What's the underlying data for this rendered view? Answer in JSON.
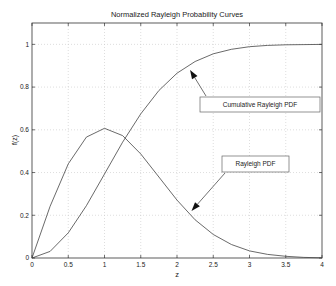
{
  "chart_data": {
    "type": "line",
    "title": "Normalized Rayleigh Probability Curves",
    "xlabel": "z",
    "ylabel": "f(z)",
    "xlim": [
      0,
      4
    ],
    "ylim": [
      0,
      1.1
    ],
    "grid": true,
    "xticks": [
      0,
      0.5,
      1,
      1.5,
      2,
      2.5,
      3,
      3.5,
      4
    ],
    "xtick_labels": [
      "0",
      "0.5",
      "1",
      "1.5",
      "2",
      "2.5",
      "3",
      "3.5",
      "4"
    ],
    "yticks": [
      0,
      0.2,
      0.4,
      0.6,
      0.8,
      1
    ],
    "ytick_labels": [
      "0",
      "0.2",
      "0.4",
      "0.6",
      "0.8",
      "1"
    ],
    "x": [
      0,
      0.25,
      0.5,
      0.75,
      1,
      1.25,
      1.5,
      1.75,
      2,
      2.25,
      2.5,
      2.75,
      3,
      3.25,
      3.5,
      3.75,
      4
    ],
    "series": [
      {
        "name": "Rayleigh PDF",
        "values": [
          0,
          0.242,
          0.441,
          0.566,
          0.607,
          0.573,
          0.487,
          0.379,
          0.271,
          0.179,
          0.11,
          0.063,
          0.033,
          0.017,
          0.008,
          0.003,
          0.001
        ]
      },
      {
        "name": "Cumulative Rayleigh PDF",
        "values": [
          0,
          0.031,
          0.118,
          0.245,
          0.393,
          0.542,
          0.675,
          0.784,
          0.865,
          0.92,
          0.956,
          0.977,
          0.989,
          0.995,
          0.998,
          0.999,
          1.0
        ]
      }
    ],
    "annotations": [
      {
        "text": "Cumulative Rayleigh PDF",
        "arrow_to": [
          2.18,
          0.88
        ]
      },
      {
        "text": "Rayleigh PDF",
        "arrow_to": [
          2.2,
          0.22
        ]
      }
    ]
  }
}
